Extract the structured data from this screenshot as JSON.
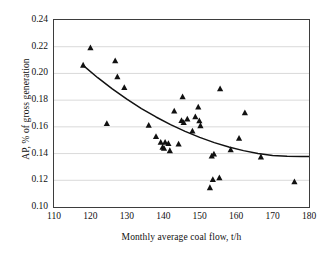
{
  "chart_data": {
    "type": "scatter",
    "title": "",
    "xlabel": "Monthly average coal flow, t/h",
    "ylabel": "AP, % of gross generation",
    "xlim": [
      110,
      180
    ],
    "ylim": [
      0.1,
      0.24
    ],
    "xticks": [
      "110",
      "120",
      "130",
      "140",
      "150",
      "160",
      "170",
      "180"
    ],
    "xtick_values": [
      110,
      120,
      130,
      140,
      150,
      160,
      170,
      180
    ],
    "yticks": [
      "0.10",
      "0.12",
      "0.14",
      "0.16",
      "0.18",
      "0.20",
      "0.22",
      "0.24"
    ],
    "ytick_values": [
      0.1,
      0.12,
      0.14,
      0.16,
      0.18,
      0.2,
      0.22,
      0.24
    ],
    "grid": "horizontal",
    "legend": "none",
    "marker": "triangle",
    "marker_color": "#111111",
    "points": [
      {
        "x": 118.0,
        "y": 0.2065
      },
      {
        "x": 120.0,
        "y": 0.2195
      },
      {
        "x": 124.5,
        "y": 0.1628
      },
      {
        "x": 126.8,
        "y": 0.2098
      },
      {
        "x": 127.4,
        "y": 0.1978
      },
      {
        "x": 129.3,
        "y": 0.1898
      },
      {
        "x": 136.0,
        "y": 0.1615
      },
      {
        "x": 138.0,
        "y": 0.153
      },
      {
        "x": 139.3,
        "y": 0.1488
      },
      {
        "x": 139.8,
        "y": 0.145
      },
      {
        "x": 140.2,
        "y": 0.1442
      },
      {
        "x": 140.5,
        "y": 0.1487
      },
      {
        "x": 141.4,
        "y": 0.1478
      },
      {
        "x": 141.8,
        "y": 0.1425
      },
      {
        "x": 143.0,
        "y": 0.1722
      },
      {
        "x": 144.2,
        "y": 0.1475
      },
      {
        "x": 145.0,
        "y": 0.165
      },
      {
        "x": 145.3,
        "y": 0.1828
      },
      {
        "x": 145.6,
        "y": 0.1635
      },
      {
        "x": 146.6,
        "y": 0.1662
      },
      {
        "x": 148.0,
        "y": 0.1572
      },
      {
        "x": 148.8,
        "y": 0.1678
      },
      {
        "x": 149.6,
        "y": 0.1752
      },
      {
        "x": 149.9,
        "y": 0.1648
      },
      {
        "x": 150.2,
        "y": 0.1612
      },
      {
        "x": 152.8,
        "y": 0.1148
      },
      {
        "x": 153.3,
        "y": 0.1385
      },
      {
        "x": 153.6,
        "y": 0.1208
      },
      {
        "x": 153.9,
        "y": 0.14
      },
      {
        "x": 155.4,
        "y": 0.1222
      },
      {
        "x": 155.6,
        "y": 0.1888
      },
      {
        "x": 158.5,
        "y": 0.1432
      },
      {
        "x": 160.8,
        "y": 0.1518
      },
      {
        "x": 162.4,
        "y": 0.1708
      },
      {
        "x": 166.8,
        "y": 0.1378
      },
      {
        "x": 176.0,
        "y": 0.1192
      }
    ],
    "trendline": {
      "name": "fitted curve",
      "color": "#111111",
      "x": [
        118,
        122,
        126,
        130,
        134,
        138,
        142,
        146,
        150,
        154,
        158,
        162,
        166,
        170,
        174,
        178,
        180
      ],
      "y": [
        0.206,
        0.1968,
        0.1884,
        0.1807,
        0.1737,
        0.1674,
        0.1617,
        0.1566,
        0.1521,
        0.1482,
        0.1449,
        0.1422,
        0.14,
        0.1386,
        0.138,
        0.1378,
        0.1378
      ]
    }
  }
}
